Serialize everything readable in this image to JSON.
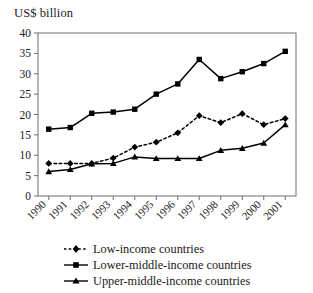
{
  "chart_data": {
    "type": "line",
    "title": "",
    "ylabel": "US$ billion",
    "xlabel": "",
    "ylim": [
      0,
      40
    ],
    "yticks": [
      0,
      5,
      10,
      15,
      20,
      25,
      30,
      35,
      40
    ],
    "grid": false,
    "legend_position": "bottom-left",
    "categories": [
      "1990",
      "1991",
      "1992",
      "1993",
      "1994",
      "1995",
      "1996",
      "1997",
      "1998",
      "1999",
      "2000",
      "2001"
    ],
    "series": [
      {
        "name": "Low-income countries",
        "marker": "diamond",
        "line_style": "dotted",
        "color": "#000000",
        "values": [
          8.0,
          8.0,
          8.0,
          9.3,
          12.0,
          13.2,
          15.5,
          19.7,
          18.0,
          20.2,
          17.5,
          19.0
        ]
      },
      {
        "name": "Lower-middle-income countries",
        "marker": "square",
        "line_style": "solid",
        "color": "#000000",
        "values": [
          16.4,
          16.8,
          20.3,
          20.6,
          21.3,
          25.0,
          27.5,
          33.5,
          28.8,
          30.5,
          32.5,
          35.5
        ]
      },
      {
        "name": "Upper-middle-income countries",
        "marker": "triangle",
        "line_style": "solid",
        "color": "#000000",
        "values": [
          6.0,
          6.5,
          7.9,
          8.0,
          9.6,
          9.2,
          9.2,
          9.2,
          11.2,
          11.7,
          13.0,
          17.5
        ]
      }
    ]
  },
  "axis": {
    "y_title": "US$ billion",
    "y_ticks": [
      "0",
      "5",
      "10",
      "15",
      "20",
      "25",
      "30",
      "35",
      "40"
    ],
    "x_ticks": [
      "1990",
      "1991",
      "1992",
      "1993",
      "1994",
      "1995",
      "1996",
      "1997",
      "1998",
      "1999",
      "2000",
      "2001"
    ]
  },
  "legend": {
    "items": [
      {
        "label": "Low-income countries"
      },
      {
        "label": "Lower-middle-income countries"
      },
      {
        "label": "Upper-middle-income countries"
      }
    ]
  }
}
